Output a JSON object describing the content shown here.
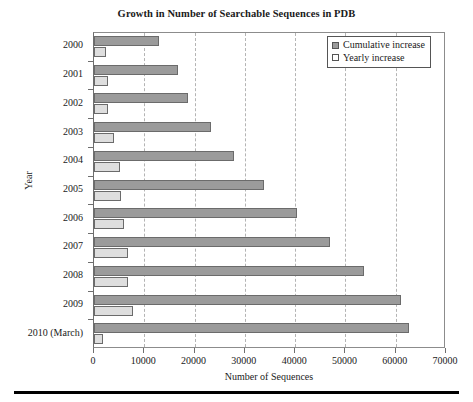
{
  "chart_data": {
    "type": "bar",
    "orientation": "horizontal",
    "title": "Growth in Number of Searchable Sequences in PDB",
    "xlabel": "Number of Sequences",
    "ylabel": "Year",
    "xlim": [
      0,
      70000
    ],
    "xticks": [
      "0",
      "10000",
      "20000",
      "30000",
      "40000",
      "50000",
      "60000",
      "70000"
    ],
    "xtick_values": [
      0,
      10000,
      20000,
      30000,
      40000,
      50000,
      60000,
      70000
    ],
    "grid": "vertical-dashed",
    "legend_position": "top-right",
    "categories": [
      "2000",
      "2001",
      "2002",
      "2003",
      "2004",
      "2005",
      "2006",
      "2007",
      "2008",
      "2009",
      "2010 (March)"
    ],
    "series": [
      {
        "name": "Cumulative increase",
        "color": "#9b9b9b",
        "values": [
          13000,
          16700,
          18700,
          23300,
          27900,
          33800,
          40400,
          47000,
          53700,
          61100,
          62600
        ]
      },
      {
        "name": "Yearly increase",
        "color": "#dedede",
        "values": [
          2400,
          2700,
          2800,
          4000,
          5100,
          5400,
          6000,
          6700,
          6800,
          7700,
          1800
        ]
      }
    ]
  }
}
